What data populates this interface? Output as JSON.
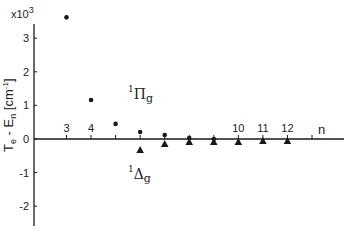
{
  "chart_data": {
    "type": "scatter",
    "title": "",
    "xlabel": "n",
    "ylabel": "Te - En [cm-1]",
    "ylabel_parts": {
      "main": "T",
      "sub1": "e",
      "mid": " - E",
      "sub2": "n",
      "unit": " [cm",
      "unit_sup": "-1",
      "unit_end": "]"
    },
    "y_multiplier": "x10",
    "y_multiplier_exp": "3",
    "ylim": [
      -2.6,
      3.4
    ],
    "xlim": [
      2,
      13.2
    ],
    "yticks": [
      -2,
      -1,
      0,
      1,
      2,
      3
    ],
    "ytick_labels": [
      "-2",
      "-1",
      "0",
      "1",
      "2",
      "3"
    ],
    "xticks": [
      3,
      4,
      5,
      6,
      7,
      8,
      9,
      10,
      11,
      12,
      13
    ],
    "xtick_labels": {
      "3": "3",
      "4": "4",
      "10": "10",
      "11": "11",
      "12": "12"
    },
    "grid": false,
    "legend": "inline labels",
    "series": [
      {
        "name": "1Πg",
        "label_sup": "1",
        "label_main": "Π",
        "label_sub": "g",
        "marker": "circle",
        "x": [
          3,
          4,
          5,
          6,
          7,
          8,
          9
        ],
        "values": [
          3.62,
          1.16,
          0.45,
          0.21,
          0.12,
          0.03,
          0.0
        ]
      },
      {
        "name": "1Δg",
        "label_sup": "1",
        "label_main": "Δ",
        "label_sub": "g",
        "marker": "triangle",
        "x": [
          6,
          7,
          8,
          9,
          10,
          11,
          12
        ],
        "values": [
          -0.33,
          -0.15,
          -0.09,
          -0.09,
          -0.09,
          -0.06,
          -0.06
        ]
      }
    ]
  },
  "colors": {
    "ink": "#1a1a1a",
    "background": "#ffffff"
  }
}
